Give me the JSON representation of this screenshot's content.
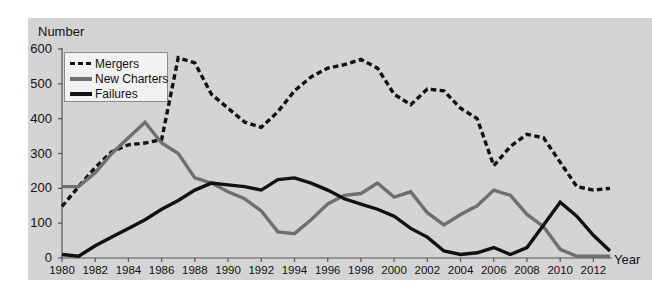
{
  "chart_data": {
    "type": "line",
    "title": "",
    "ylabel": "Number",
    "xlabel": "Year",
    "ylim": [
      0,
      600
    ],
    "yticks": [
      0,
      100,
      200,
      300,
      400,
      500,
      600
    ],
    "xlim": [
      1980,
      2013
    ],
    "xticks": [
      1980,
      1982,
      1984,
      1986,
      1988,
      1990,
      1992,
      1994,
      1996,
      1998,
      2000,
      2002,
      2004,
      2006,
      2008,
      2010,
      2012
    ],
    "grid": false,
    "legend_position": "upper-left",
    "x": [
      1980,
      1981,
      1982,
      1983,
      1984,
      1985,
      1986,
      1987,
      1988,
      1989,
      1990,
      1991,
      1992,
      1993,
      1994,
      1995,
      1996,
      1997,
      1998,
      1999,
      2000,
      2001,
      2002,
      2003,
      2004,
      2005,
      2006,
      2007,
      2008,
      2009,
      2010,
      2011,
      2012,
      2013
    ],
    "series": [
      {
        "name": "Mergers",
        "style": "dashed",
        "color": "#111111",
        "values": [
          148,
          205,
          260,
          305,
          325,
          330,
          340,
          575,
          560,
          470,
          430,
          390,
          375,
          420,
          480,
          520,
          545,
          555,
          570,
          545,
          470,
          440,
          485,
          480,
          430,
          400,
          265,
          320,
          355,
          345,
          275,
          205,
          195,
          200
        ]
      },
      {
        "name": "New Charters",
        "style": "solid",
        "color": "#6f6f6f",
        "values": [
          205,
          205,
          245,
          300,
          345,
          390,
          330,
          300,
          230,
          215,
          190,
          170,
          135,
          75,
          70,
          110,
          155,
          180,
          185,
          215,
          175,
          190,
          130,
          95,
          125,
          150,
          195,
          180,
          125,
          90,
          25,
          5,
          5,
          5
        ]
      },
      {
        "name": "Failures",
        "style": "solid",
        "color": "#111111",
        "values": [
          10,
          5,
          35,
          60,
          85,
          110,
          140,
          165,
          195,
          215,
          210,
          205,
          195,
          225,
          230,
          215,
          195,
          170,
          155,
          140,
          120,
          85,
          60,
          20,
          10,
          15,
          30,
          10,
          30,
          95,
          160,
          120,
          65,
          20
        ]
      }
    ]
  },
  "axis": {
    "ytitle": "Number",
    "xtitle": "Year",
    "ytick_labels": [
      "0",
      "100",
      "200",
      "300",
      "400",
      "500",
      "600"
    ],
    "xtick_labels": [
      "1980",
      "1982",
      "1984",
      "1986",
      "1988",
      "1990",
      "1992",
      "1994",
      "1996",
      "1998",
      "2000",
      "2002",
      "2004",
      "2006",
      "2008",
      "2010",
      "2012"
    ]
  },
  "legend": {
    "items": [
      {
        "label": "Mergers",
        "key": "dashed-line-key"
      },
      {
        "label": "New Charters",
        "key": "gray-line-key"
      },
      {
        "label": "Failures",
        "key": "black-line-key"
      }
    ]
  },
  "colors": {
    "panel_background": "#d4d4d4",
    "figure_background": "#ffffff",
    "mergers": "#111111",
    "new_charters": "#6f6f6f",
    "failures": "#111111",
    "legend_background": "#f2f2f2"
  }
}
